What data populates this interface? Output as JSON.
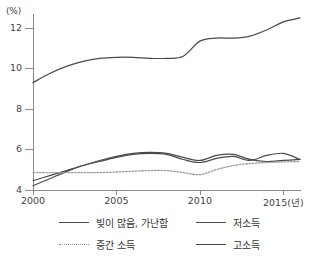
{
  "axes": {
    "unit_label": "(%)",
    "y_ticks": [
      "12",
      "10",
      "8",
      "6",
      "4"
    ],
    "y_values": [
      12,
      10,
      8,
      6,
      4
    ],
    "x_ticks": [
      "2000",
      "2005",
      "2010",
      "2015(년)"
    ],
    "x_values": [
      2000,
      2005,
      2010,
      2015
    ]
  },
  "legend": {
    "items": [
      {
        "label": "빚이 많음, 가난함",
        "style": "solid",
        "color": "#4a4a4a"
      },
      {
        "label": "저소득",
        "style": "solid",
        "color": "#4a4a4a"
      },
      {
        "label": "중간 소득",
        "style": "dotted",
        "color": "#9a9a9a"
      },
      {
        "label": "고소득",
        "style": "solid",
        "color": "#4a4a4a"
      }
    ]
  },
  "chart_data": {
    "type": "line",
    "title": "",
    "xlabel": "년",
    "ylabel": "%",
    "xlim": [
      2000,
      2016
    ],
    "ylim": [
      4,
      13
    ],
    "grid": false,
    "legend_position": "bottom",
    "x": [
      2000,
      2001,
      2002,
      2003,
      2004,
      2005,
      2006,
      2007,
      2008,
      2009,
      2010,
      2011,
      2012,
      2013,
      2014,
      2015,
      2016
    ],
    "series": [
      {
        "name": "고소득",
        "style": "solid",
        "color": "#4a4a4a",
        "values": [
          9.3,
          9.75,
          10.1,
          10.35,
          10.5,
          10.55,
          10.55,
          10.5,
          10.5,
          10.6,
          11.35,
          11.5,
          11.5,
          11.6,
          11.9,
          12.3,
          12.5
        ]
      },
      {
        "name": "빚이 많음, 가난함",
        "style": "solid",
        "color": "#4a4a4a",
        "values": [
          4.2,
          4.55,
          4.9,
          5.2,
          5.45,
          5.65,
          5.8,
          5.85,
          5.8,
          5.6,
          5.45,
          5.7,
          5.75,
          5.5,
          5.4,
          5.45,
          5.5
        ]
      },
      {
        "name": "저소득",
        "style": "solid",
        "color": "#4a4a4a",
        "values": [
          4.45,
          4.7,
          4.95,
          5.2,
          5.4,
          5.6,
          5.75,
          5.8,
          5.75,
          5.5,
          5.35,
          5.55,
          5.65,
          5.45,
          5.7,
          5.8,
          5.5
        ]
      },
      {
        "name": "중간 소득",
        "style": "dotted",
        "color": "#9a9a9a",
        "values": [
          4.85,
          4.85,
          4.85,
          4.85,
          4.85,
          4.88,
          4.92,
          4.95,
          4.95,
          4.85,
          4.75,
          5.0,
          5.2,
          5.3,
          5.35,
          5.38,
          5.4
        ]
      }
    ]
  }
}
